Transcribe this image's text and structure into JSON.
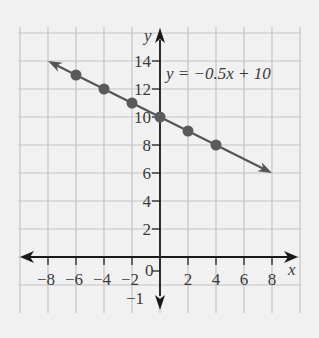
{
  "chart_data": {
    "type": "line",
    "title": "",
    "equation_label": "y = −0.5x + 10",
    "xlabel": "x",
    "ylabel": "y",
    "x_ticks": [
      -8,
      -6,
      -4,
      -2,
      2,
      4,
      6,
      8
    ],
    "x_tick_labels": [
      "−8",
      "−6",
      "−4",
      "−2",
      "2",
      "4",
      "6",
      "8"
    ],
    "y_ticks": [
      2,
      4,
      6,
      8,
      10,
      12,
      14
    ],
    "y_tick_labels": [
      "2",
      "4",
      "6",
      "8",
      "10",
      "12",
      "14"
    ],
    "origin_label": "0",
    "neg_y_label": "−1",
    "xlim": [
      -10,
      10
    ],
    "ylim": [
      -2,
      16
    ],
    "grid": true,
    "series": [
      {
        "name": "y = -0.5x + 10",
        "slope": -0.5,
        "intercept": 10,
        "line_from": [
          -8,
          14
        ],
        "line_to": [
          8,
          6
        ],
        "points": [
          [
            -6,
            13
          ],
          [
            -4,
            12
          ],
          [
            -2,
            11
          ],
          [
            0,
            10
          ],
          [
            2,
            9
          ],
          [
            4,
            8
          ]
        ]
      }
    ],
    "colors": {
      "line": "#555555",
      "axis": "#1a1a1a",
      "grid": "#c4c4c4",
      "background": "#f1f1f1"
    }
  }
}
